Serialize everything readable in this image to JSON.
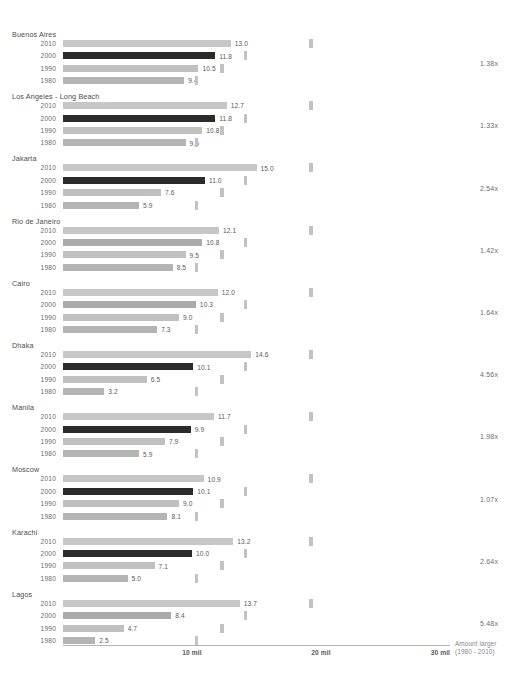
{
  "chart_data": {
    "type": "bar",
    "title": "",
    "subtitle": "",
    "xlabel": "",
    "ylabel": "",
    "orientation": "horizontal",
    "grid": false,
    "legend_position": "bottom-right",
    "xlim": [
      0,
      30
    ],
    "x_unit": "mil",
    "axis_ticks": [
      {
        "value": 10,
        "label": "10 mil"
      },
      {
        "value": 20,
        "label": "20 mil"
      },
      {
        "value": 30,
        "label": "30 mil"
      }
    ],
    "categories": [
      "2010",
      "2000",
      "1990",
      "1980"
    ],
    "annotation_lines": [
      "Amount larger",
      "(1980 - 2010)"
    ],
    "annotation_column_header": "Amount larger (1980 - 2010)",
    "highlight_series": "2000",
    "colors": {
      "bar_2010": "#c7c7c7",
      "bar_2000_normal": "#aaaaaa",
      "bar_2000_highlight": "#2b2b2b",
      "bar_1990": "#c0c0c0",
      "bar_1980": "#b4b4b4",
      "rank_tick": "#c2c2c2",
      "axis_line": "#b5b5b5",
      "text": "#595959",
      "multiplier_text": "#6e6e6e"
    },
    "rank_tick_values": [
      19.1,
      14.0,
      12.2,
      10.2
    ],
    "groups": [
      {
        "city": "Buenos Aires",
        "multiplier": "1.38x",
        "highlighted": true,
        "values": [
          {
            "year": "2010",
            "value": 13.0,
            "label": "13.0"
          },
          {
            "year": "2000",
            "value": 11.8,
            "label": "11.8"
          },
          {
            "year": "1990",
            "value": 10.5,
            "label": "10.5"
          },
          {
            "year": "1980",
            "value": 9.4,
            "label": "9.4"
          }
        ]
      },
      {
        "city": "Los Angeles - Long Beach",
        "multiplier": "1.33x",
        "highlighted": true,
        "values": [
          {
            "year": "2010",
            "value": 12.7,
            "label": "12.7"
          },
          {
            "year": "2000",
            "value": 11.8,
            "label": "11.8"
          },
          {
            "year": "1990",
            "value": 10.8,
            "label": "10.8"
          },
          {
            "year": "1980",
            "value": 9.5,
            "label": "9.5"
          }
        ]
      },
      {
        "city": "Jakarta",
        "multiplier": "2.54x",
        "highlighted": true,
        "values": [
          {
            "year": "2010",
            "value": 15.0,
            "label": "15.0"
          },
          {
            "year": "2000",
            "value": 11.0,
            "label": "11.0"
          },
          {
            "year": "1990",
            "value": 7.6,
            "label": "7.6"
          },
          {
            "year": "1980",
            "value": 5.9,
            "label": "5.9"
          }
        ]
      },
      {
        "city": "Rio de Janeiro",
        "multiplier": "1.42x",
        "highlighted": false,
        "values": [
          {
            "year": "2010",
            "value": 12.1,
            "label": "12.1"
          },
          {
            "year": "2000",
            "value": 10.8,
            "label": "10.8"
          },
          {
            "year": "1990",
            "value": 9.5,
            "label": "9.5"
          },
          {
            "year": "1980",
            "value": 8.5,
            "label": "8.5"
          }
        ]
      },
      {
        "city": "Cairo",
        "multiplier": "1.64x",
        "highlighted": false,
        "values": [
          {
            "year": "2010",
            "value": 12.0,
            "label": "12.0"
          },
          {
            "year": "2000",
            "value": 10.3,
            "label": "10.3"
          },
          {
            "year": "1990",
            "value": 9.0,
            "label": "9.0"
          },
          {
            "year": "1980",
            "value": 7.3,
            "label": "7.3"
          }
        ]
      },
      {
        "city": "Dhaka",
        "multiplier": "4.56x",
        "highlighted": true,
        "values": [
          {
            "year": "2010",
            "value": 14.6,
            "label": "14.6"
          },
          {
            "year": "2000",
            "value": 10.1,
            "label": "10.1"
          },
          {
            "year": "1990",
            "value": 6.5,
            "label": "6.5"
          },
          {
            "year": "1980",
            "value": 3.2,
            "label": "3.2"
          }
        ]
      },
      {
        "city": "Manila",
        "multiplier": "1.98x",
        "highlighted": true,
        "values": [
          {
            "year": "2010",
            "value": 11.7,
            "label": "11.7"
          },
          {
            "year": "2000",
            "value": 9.9,
            "label": "9.9"
          },
          {
            "year": "1990",
            "value": 7.9,
            "label": "7.9"
          },
          {
            "year": "1980",
            "value": 5.9,
            "label": "5.9"
          }
        ]
      },
      {
        "city": "Moscow",
        "multiplier": "1.07x",
        "highlighted": true,
        "values": [
          {
            "year": "2010",
            "value": 10.9,
            "label": "10.9"
          },
          {
            "year": "2000",
            "value": 10.1,
            "label": "10.1"
          },
          {
            "year": "1990",
            "value": 9.0,
            "label": "9.0"
          },
          {
            "year": "1980",
            "value": 8.1,
            "label": "8.1"
          }
        ]
      },
      {
        "city": "Karachi",
        "multiplier": "2.64x",
        "highlighted": true,
        "values": [
          {
            "year": "2010",
            "value": 13.2,
            "label": "13.2"
          },
          {
            "year": "2000",
            "value": 10.0,
            "label": "10.0"
          },
          {
            "year": "1990",
            "value": 7.1,
            "label": "7.1"
          },
          {
            "year": "1980",
            "value": 5.0,
            "label": "5.0"
          }
        ]
      },
      {
        "city": "Lagos",
        "multiplier": "5.48x",
        "highlighted": false,
        "values": [
          {
            "year": "2010",
            "value": 13.7,
            "label": "13.7"
          },
          {
            "year": "2000",
            "value": 8.4,
            "label": "8.4"
          },
          {
            "year": "1990",
            "value": 4.7,
            "label": "4.7"
          },
          {
            "year": "1980",
            "value": 2.5,
            "label": "2.5"
          }
        ]
      }
    ]
  }
}
